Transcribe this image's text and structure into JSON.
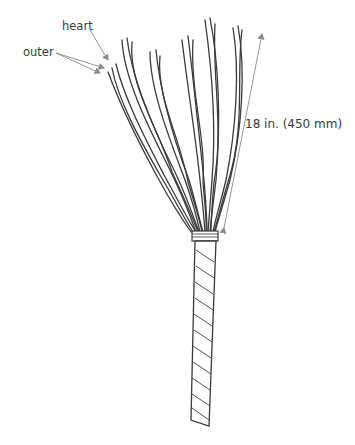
{
  "figure": {
    "labels": {
      "heart": "heart",
      "outer": "outer",
      "dimension": "18 in. (450 mm)"
    },
    "colors": {
      "ink": "#3a3a3a",
      "arrow": "#8a8a8a",
      "background": "#ffffff"
    }
  }
}
